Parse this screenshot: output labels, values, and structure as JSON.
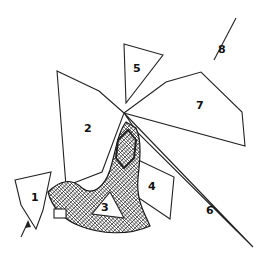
{
  "figure": {
    "labels": [
      {
        "id": "1",
        "text": "1"
      },
      {
        "id": "2",
        "text": "2"
      },
      {
        "id": "3",
        "text": "3"
      },
      {
        "id": "4",
        "text": "4"
      },
      {
        "id": "5",
        "text": "5"
      },
      {
        "id": "6",
        "text": "6"
      },
      {
        "id": "7",
        "text": "7"
      },
      {
        "id": "8",
        "text": "8"
      }
    ],
    "arrow": {
      "text": ""
    },
    "colors": {
      "ink": "#222222",
      "background": "#ffffff"
    }
  }
}
